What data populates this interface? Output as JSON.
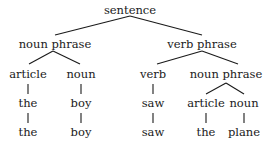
{
  "diagram": {
    "type": "parse-tree",
    "root": "sentence",
    "nodes": {
      "sentence": "sentence",
      "np1": "noun  phrase",
      "vp": "verb  phrase",
      "np1_article": "article",
      "np1_noun": "noun",
      "vp_verb": "verb",
      "np2": "noun  phrase",
      "np1_the": "the",
      "np1_boy": "boy",
      "vp_saw": "saw",
      "np2_article": "article",
      "np2_noun": "noun",
      "w_the1": "the",
      "w_boy": "boy",
      "w_saw": "saw",
      "w_the2": "the",
      "w_plane": "plane"
    },
    "edges": [
      [
        "sentence",
        "noun phrase"
      ],
      [
        "sentence",
        "verb phrase"
      ],
      [
        "noun phrase",
        "article"
      ],
      [
        "noun phrase",
        "noun"
      ],
      [
        "verb phrase",
        "verb"
      ],
      [
        "verb phrase",
        "noun phrase"
      ],
      [
        "article",
        "the"
      ],
      [
        "noun",
        "boy"
      ],
      [
        "verb",
        "saw"
      ],
      [
        "noun phrase",
        "article"
      ],
      [
        "noun phrase",
        "noun"
      ],
      [
        "the",
        "the"
      ],
      [
        "boy",
        "boy"
      ],
      [
        "saw",
        "saw"
      ],
      [
        "article",
        "the"
      ],
      [
        "noun",
        "plane"
      ]
    ],
    "sentence_text": "the boy saw the plane"
  }
}
